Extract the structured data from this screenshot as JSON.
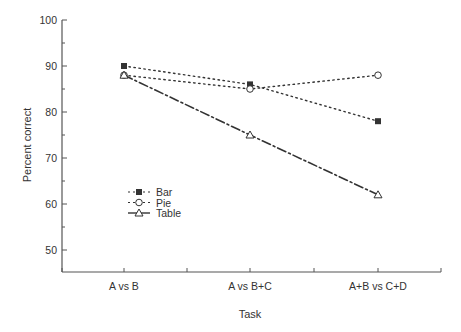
{
  "chart_data": {
    "type": "line",
    "title": "",
    "xlabel": "Task",
    "ylabel": "Percent correct",
    "categories": [
      "A vs B",
      "A vs B+C",
      "A+B vs C+D"
    ],
    "ylim": [
      45,
      100
    ],
    "yticks": [
      50,
      60,
      70,
      80,
      90,
      100
    ],
    "grid": false,
    "legend_position": "inside-left-middle",
    "series": [
      {
        "name": "Bar",
        "values": [
          90,
          86,
          78
        ],
        "marker": "filled-square",
        "line": "dotted"
      },
      {
        "name": "Pie",
        "values": [
          88,
          85,
          88
        ],
        "marker": "open-circle",
        "line": "dotted"
      },
      {
        "name": "Table",
        "values": [
          88,
          75,
          62
        ],
        "marker": "open-triangle",
        "line": "dash-dot"
      }
    ]
  },
  "colors": {
    "ink": "#333333",
    "axis": "#555555",
    "background": "#ffffff"
  }
}
